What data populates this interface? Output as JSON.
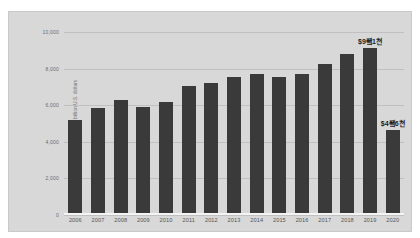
{
  "chart_data": {
    "type": "bar",
    "title": "",
    "subtitle": "",
    "xlabel": "",
    "ylabel": "Contribution to GDP in billion U.S. dollars",
    "ylim": [
      0,
      10000
    ],
    "y_ticks": [
      0,
      2000,
      4000,
      6000,
      8000,
      10000
    ],
    "y_tick_labels": [
      "0",
      "2,000",
      "4,000",
      "6,000",
      "8,000",
      "10,000"
    ],
    "grid": true,
    "legend": null,
    "bar_color": "#3a3a3a",
    "plot_background": "#d8d8d8",
    "categories": [
      "2006",
      "2007",
      "2008",
      "2009",
      "2010",
      "2011",
      "2012",
      "2013",
      "2014",
      "2015",
      "2016",
      "2017",
      "2018",
      "2019",
      "2020"
    ],
    "values": [
      5150,
      5800,
      6250,
      5850,
      6150,
      7000,
      7200,
      7500,
      7700,
      7500,
      7700,
      8250,
      8800,
      9100,
      4600
    ],
    "annotations": [
      {
        "category": "2019",
        "text": "$9죀1천"
      },
      {
        "category": "2020",
        "text": "$4죀6천"
      }
    ]
  }
}
